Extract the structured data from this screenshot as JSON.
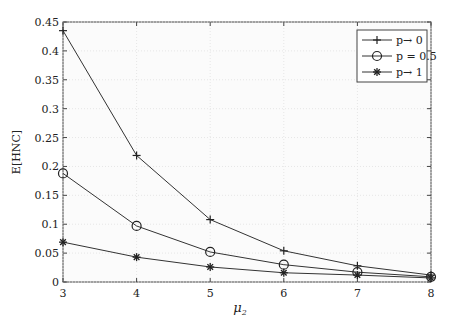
{
  "chart_data": {
    "type": "line",
    "title": "",
    "xlabel": "μ2",
    "ylabel": "E[HNC]",
    "x": [
      3,
      4,
      5,
      6,
      7,
      8
    ],
    "xlim": [
      3,
      8
    ],
    "ylim": [
      0,
      0.45
    ],
    "xticks": [
      "3",
      "4",
      "5",
      "6",
      "7",
      "8"
    ],
    "yticks": [
      "0",
      "0.05",
      "0.1",
      "0.15",
      "0.2",
      "0.25",
      "0.3",
      "0.35",
      "0.4",
      "0.45"
    ],
    "grid": true,
    "legend_position": "upper right",
    "series": [
      {
        "name": "p→ 0",
        "marker": "plus",
        "values": [
          0.435,
          0.219,
          0.108,
          0.054,
          0.028,
          0.012
        ]
      },
      {
        "name": "p = 0.5",
        "marker": "circle",
        "values": [
          0.188,
          0.097,
          0.052,
          0.03,
          0.017,
          0.009
        ]
      },
      {
        "name": "p→ 1",
        "marker": "star",
        "values": [
          0.069,
          0.043,
          0.026,
          0.016,
          0.012,
          0.007
        ]
      }
    ]
  },
  "axes": {
    "xlabel_main": "μ",
    "xlabel_sub": "2",
    "ylabel": "E[HNC]"
  },
  "legend": [
    "p→ 0",
    "p = 0.5",
    "p→ 1"
  ]
}
